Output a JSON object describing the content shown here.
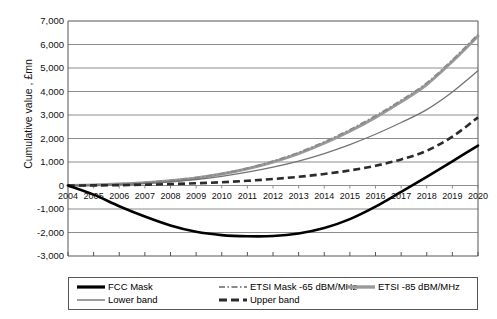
{
  "chart_data": {
    "type": "line",
    "title": "",
    "xlabel": "",
    "ylabel": "Cumulative value , £mn",
    "x": [
      2004,
      2005,
      2006,
      2007,
      2008,
      2009,
      2010,
      2011,
      2012,
      2013,
      2014,
      2015,
      2016,
      2017,
      2018,
      2019,
      2020
    ],
    "xlim": [
      2004,
      2020
    ],
    "ylim": [
      -3000,
      7000
    ],
    "ytick_labels": [
      "7,000",
      "6,000",
      "5,000",
      "4,000",
      "3,000",
      "2,000",
      "1,000",
      "0",
      "-1,000",
      "-2,000",
      "-3,000"
    ],
    "ytick_values": [
      7000,
      6000,
      5000,
      4000,
      3000,
      2000,
      1000,
      0,
      -1000,
      -2000,
      -3000
    ],
    "xtick_labels": [
      "2004",
      "2005",
      "2006",
      "2007",
      "2008",
      "2009",
      "2010",
      "2011",
      "2012",
      "2013",
      "2014",
      "2015",
      "2016",
      "2017",
      "2018",
      "2019",
      "2020"
    ],
    "grid": true,
    "legend_position": "bottom",
    "series": [
      {
        "name": "FCC Mask",
        "style": "solid-thick-black",
        "color": "#000000",
        "values": [
          0,
          -390,
          -880,
          -1320,
          -1700,
          -1970,
          -2110,
          -2160,
          -2150,
          -2040,
          -1810,
          -1430,
          -900,
          -270,
          370,
          1030,
          1700
        ]
      },
      {
        "name": "ETSI Mask -65 dBM/MHz",
        "style": "dash-dot-gray",
        "color": "#8a8a8a",
        "values": [
          0,
          20,
          60,
          120,
          210,
          330,
          500,
          730,
          1030,
          1400,
          1850,
          2370,
          2960,
          3620,
          4360,
          5340,
          6420
        ]
      },
      {
        "name": "ETSI -85 dBM/MHz",
        "style": "solid-thick-gray",
        "color": "#9a9a9a",
        "values": [
          0,
          20,
          60,
          120,
          205,
          320,
          485,
          710,
          1000,
          1360,
          1800,
          2310,
          2900,
          3560,
          4300,
          5280,
          6360
        ]
      },
      {
        "name": "Lower band",
        "style": "solid-thin-gray",
        "color": "#737373",
        "values": [
          0,
          10,
          40,
          90,
          160,
          255,
          390,
          565,
          780,
          1040,
          1360,
          1740,
          2180,
          2680,
          3230,
          3980,
          4880
        ]
      },
      {
        "name": "Upper band",
        "style": "dashed-thick-dark",
        "color": "#2b2b2b",
        "values": [
          0,
          5,
          15,
          35,
          60,
          95,
          140,
          200,
          275,
          370,
          490,
          640,
          840,
          1110,
          1480,
          2080,
          2900
        ]
      }
    ]
  },
  "legend": {
    "items": [
      {
        "label": "FCC Mask",
        "swatch": "solid-thick-black-swatch"
      },
      {
        "label": "ETSI Mask -65 dBM/MHz",
        "swatch": "dash-dot-gray-swatch"
      },
      {
        "label": "ETSI -85 dBM/MHz",
        "swatch": "solid-thick-gray-swatch"
      },
      {
        "label": "Lower band",
        "swatch": "solid-thin-gray-swatch"
      },
      {
        "label": "Upper band",
        "swatch": "dashed-thick-dark-swatch"
      }
    ]
  }
}
